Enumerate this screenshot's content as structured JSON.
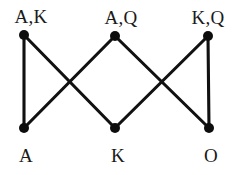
{
  "diagram": {
    "background_color": "#ffffff",
    "node_color": "#0d0d0d",
    "edge_color": "#111111",
    "label_color": "#1a1a1a",
    "node_radius": 5,
    "edge_width": 3.1,
    "width": 243,
    "height": 175,
    "nodes": [
      {
        "id": "top-left",
        "label": "A,K",
        "x": 24,
        "y": 35,
        "label_x": 31,
        "label_y": 7,
        "row": "top"
      },
      {
        "id": "top-middle",
        "label": "A,Q",
        "x": 115,
        "y": 36,
        "label_x": 121,
        "label_y": 8,
        "row": "top"
      },
      {
        "id": "top-right",
        "label": "K,Q",
        "x": 208,
        "y": 36,
        "label_x": 208,
        "label_y": 8,
        "row": "top"
      },
      {
        "id": "bottom-left",
        "label": "A",
        "x": 24,
        "y": 128,
        "label_x": 26,
        "label_y": 146,
        "row": "bottom"
      },
      {
        "id": "bottom-middle",
        "label": "K",
        "x": 115,
        "y": 128,
        "label_x": 118,
        "label_y": 146,
        "row": "bottom"
      },
      {
        "id": "bottom-right",
        "label": "O",
        "x": 209,
        "y": 128,
        "label_x": 211,
        "label_y": 146,
        "row": "bottom"
      }
    ],
    "edges": [
      {
        "id": "edge-ak-a",
        "from": "top-left",
        "to": "bottom-left",
        "x1": 24,
        "y1": 35,
        "x2": 24,
        "y2": 128,
        "kind": "vertical"
      },
      {
        "id": "edge-ak-k",
        "from": "top-left",
        "to": "bottom-middle",
        "x1": 24,
        "y1": 35,
        "x2": 115,
        "y2": 128,
        "kind": "diagonal"
      },
      {
        "id": "edge-aq-a",
        "from": "top-middle",
        "to": "bottom-left",
        "x1": 115,
        "y1": 36,
        "x2": 24,
        "y2": 128,
        "kind": "diagonal"
      },
      {
        "id": "edge-aq-o",
        "from": "top-middle",
        "to": "bottom-right",
        "x1": 115,
        "y1": 36,
        "x2": 209,
        "y2": 128,
        "kind": "diagonal"
      },
      {
        "id": "edge-kq-k",
        "from": "top-right",
        "to": "bottom-middle",
        "x1": 208,
        "y1": 36,
        "x2": 115,
        "y2": 128,
        "kind": "diagonal"
      },
      {
        "id": "edge-kq-o",
        "from": "top-right",
        "to": "bottom-right",
        "x1": 208,
        "y1": 36,
        "x2": 209,
        "y2": 128,
        "kind": "vertical"
      }
    ]
  }
}
